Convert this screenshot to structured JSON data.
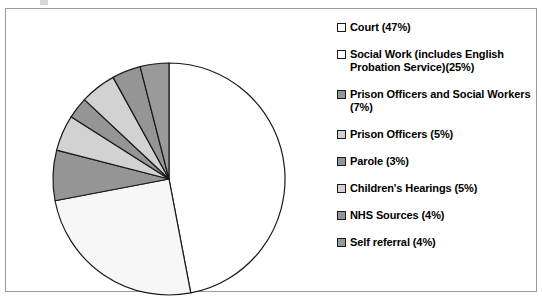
{
  "chart_data": {
    "type": "pie",
    "title": "",
    "legend_position": "right",
    "categories": [
      "Court",
      "Social Work (includes English Probation Service)",
      "Prison Officers and Social Workers",
      "Prison Officers",
      "Parole",
      "Children's Hearings",
      "NHS Sources",
      "Self referral"
    ],
    "values": [
      47,
      25,
      7,
      5,
      3,
      5,
      4,
      4
    ],
    "unit": "%",
    "start_angle_deg": 0,
    "direction": "clockwise",
    "slice_colors": [
      "#ffffff",
      "#f7f7f7",
      "#959595",
      "#d2d2d2",
      "#959595",
      "#d2d2d2",
      "#959595",
      "#9a9a9a"
    ],
    "slice_outline_color": "#1a1a1a"
  },
  "legend": {
    "items": [
      {
        "label": "Court (47%)",
        "swatch": "#ffffff",
        "name": "court"
      },
      {
        "label": "Social Work (includes English Probation Service)(25%)",
        "swatch": "#ffffff",
        "name": "social-work"
      },
      {
        "label": "Prison Officers and Social Workers (7%)",
        "swatch": "#959595",
        "name": "prison-officers-and-social-workers"
      },
      {
        "label": "Prison Officers (5%)",
        "swatch": "#d2d2d2",
        "name": "prison-officers"
      },
      {
        "label": "Parole (3%)",
        "swatch": "#959595",
        "name": "parole"
      },
      {
        "label": "Children's Hearings (5%)",
        "swatch": "#d2d2d2",
        "name": "childrens-hearings"
      },
      {
        "label": "NHS Sources (4%)",
        "swatch": "#959595",
        "name": "nhs-sources"
      },
      {
        "label": "Self referral (4%)",
        "swatch": "#9a9a9a",
        "name": "self-referral"
      }
    ]
  },
  "pie_geometry": {
    "cx": 163,
    "cy": 170,
    "r": 116
  }
}
